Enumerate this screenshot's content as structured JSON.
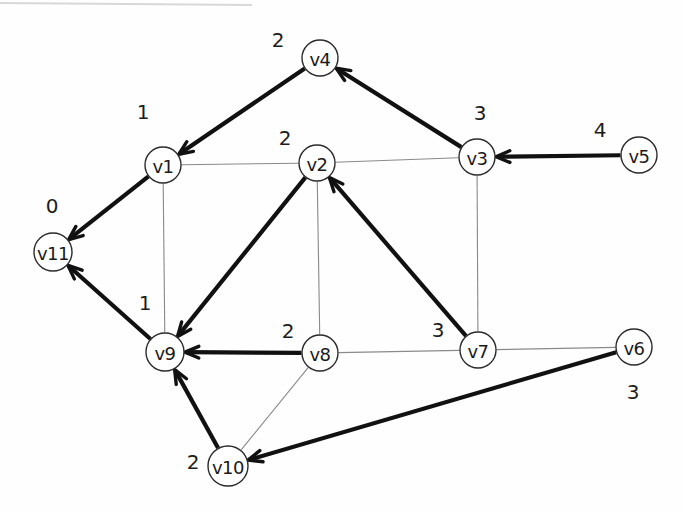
{
  "diagram": {
    "type": "node-link-diagram",
    "background_color": "#fefefe",
    "node_fill": "#ffffff",
    "node_stroke": "#2b2b2b",
    "thin_edge_color": "#8a8a8a",
    "thick_edge_color": "#111111"
  },
  "nodes": [
    {
      "id": "v1",
      "label": "v1",
      "x": 163,
      "y": 165,
      "r": 18
    },
    {
      "id": "v2",
      "label": "v2",
      "x": 317,
      "y": 163,
      "r": 18
    },
    {
      "id": "v3",
      "label": "v3",
      "x": 477,
      "y": 157,
      "r": 18
    },
    {
      "id": "v4",
      "label": "v4",
      "x": 320,
      "y": 58,
      "r": 18
    },
    {
      "id": "v5",
      "label": "v5",
      "x": 639,
      "y": 155,
      "r": 18
    },
    {
      "id": "v6",
      "label": "v6",
      "x": 634,
      "y": 347,
      "r": 18
    },
    {
      "id": "v7",
      "label": "v7",
      "x": 478,
      "y": 350,
      "r": 18
    },
    {
      "id": "v8",
      "label": "v8",
      "x": 320,
      "y": 353,
      "r": 18
    },
    {
      "id": "v9",
      "label": "v9",
      "x": 165,
      "y": 352,
      "r": 19
    },
    {
      "id": "v10",
      "label": "v10",
      "x": 228,
      "y": 466,
      "r": 20
    },
    {
      "id": "v11",
      "label": "v11",
      "x": 53,
      "y": 252,
      "r": 19
    }
  ],
  "node_weights": [
    {
      "node": "v4",
      "value": "2",
      "x": 278,
      "y": 40
    },
    {
      "node": "v1",
      "value": "1",
      "x": 143,
      "y": 112
    },
    {
      "node": "v2",
      "value": "2",
      "x": 285,
      "y": 138
    },
    {
      "node": "v3",
      "value": "3",
      "x": 480,
      "y": 113
    },
    {
      "node": "v5",
      "value": "4",
      "x": 600,
      "y": 130
    },
    {
      "node": "v11",
      "value": "0",
      "x": 52,
      "y": 206
    },
    {
      "node": "v9",
      "value": "1",
      "x": 145,
      "y": 303
    },
    {
      "node": "v8",
      "value": "2",
      "x": 288,
      "y": 331
    },
    {
      "node": "v7",
      "value": "3",
      "x": 438,
      "y": 330
    },
    {
      "node": "v6",
      "value": "3",
      "x": 633,
      "y": 392
    },
    {
      "node": "v10",
      "value": "2",
      "x": 193,
      "y": 462
    }
  ],
  "edges": [
    {
      "id": "e-v4-v1",
      "from": "v4",
      "to": "v1",
      "style": "thick",
      "directed": true
    },
    {
      "id": "e-v3-v4",
      "from": "v3",
      "to": "v4",
      "style": "thick",
      "directed": true
    },
    {
      "id": "e-v5-v3",
      "from": "v5",
      "to": "v3",
      "style": "thick",
      "directed": true
    },
    {
      "id": "e-v1-v11",
      "from": "v1",
      "to": "v11",
      "style": "thick",
      "directed": true
    },
    {
      "id": "e-v9-v11",
      "from": "v9",
      "to": "v11",
      "style": "thick",
      "directed": true
    },
    {
      "id": "e-v2-v9",
      "from": "v2",
      "to": "v9",
      "style": "thick",
      "directed": true
    },
    {
      "id": "e-v7-v2",
      "from": "v7",
      "to": "v2",
      "style": "thick",
      "directed": true
    },
    {
      "id": "e-v8-v9",
      "from": "v8",
      "to": "v9",
      "style": "thick",
      "directed": true
    },
    {
      "id": "e-v10-v9",
      "from": "v10",
      "to": "v9",
      "style": "thick",
      "directed": true
    },
    {
      "id": "e-v6-v10",
      "from": "v6",
      "to": "v10",
      "style": "thick",
      "directed": true
    },
    {
      "id": "e-v1-v2",
      "from": "v1",
      "to": "v2",
      "style": "thin",
      "directed": false
    },
    {
      "id": "e-v2-v3",
      "from": "v2",
      "to": "v3",
      "style": "thin",
      "directed": false
    },
    {
      "id": "e-v1-v9",
      "from": "v1",
      "to": "v9",
      "style": "thin",
      "directed": false
    },
    {
      "id": "e-v2-v8",
      "from": "v2",
      "to": "v8",
      "style": "thin",
      "directed": false
    },
    {
      "id": "e-v3-v7",
      "from": "v3",
      "to": "v7",
      "style": "thin",
      "directed": false
    },
    {
      "id": "e-v8-v7",
      "from": "v8",
      "to": "v7",
      "style": "thin",
      "directed": false
    },
    {
      "id": "e-v7-v6",
      "from": "v7",
      "to": "v6",
      "style": "thin",
      "directed": false
    },
    {
      "id": "e-v8-v10",
      "from": "v8",
      "to": "v10",
      "style": "thin",
      "directed": false
    }
  ],
  "artifacts": [
    {
      "id": "top-scanline",
      "x1": 0,
      "y1": 3,
      "x2": 252,
      "y2": 5
    }
  ]
}
